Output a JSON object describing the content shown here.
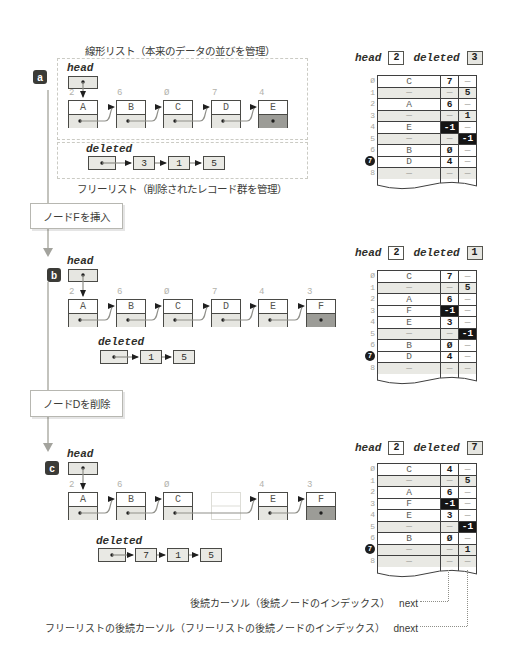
{
  "figure": {
    "linear_list_title": "線形リスト（本来のデータの並びを管理）",
    "free_list_title": "フリーリスト（削除されたレコード群を管理）"
  },
  "steps": [
    {
      "label": "ノードFを挿入"
    },
    {
      "label": "ノードDを削除"
    }
  ],
  "annotations": [
    {
      "text": "後続カーソル（後続ノードのインデックス）",
      "key": "next"
    },
    {
      "text": "フリーリストの後続カーソル（フリーリストの後続ノードのインデックス）",
      "key": "dnext"
    }
  ],
  "colors": {
    "null_cell": "#9c9c97",
    "dark_cell": "#151515",
    "free_row": "#e9e9e4",
    "node_fill": "#e6e6e1",
    "panel_marker": "#3b3b37"
  },
  "panels": [
    {
      "id": "a",
      "head_label": "head",
      "deleted_label": "deleted",
      "nodes": [
        {
          "index": "2",
          "letter": "A"
        },
        {
          "index": "6",
          "letter": "B"
        },
        {
          "index": "Ø",
          "letter": "C"
        },
        {
          "index": "7",
          "letter": "D"
        },
        {
          "index": "4",
          "letter": "E",
          "isNull": true
        }
      ],
      "deleted_chain": [
        "3",
        "1",
        "5"
      ],
      "table": {
        "head_label": "head",
        "head": "2",
        "deleted_label": "deleted",
        "deleted": "3",
        "rows": [
          {
            "i": "Ø",
            "v": "C",
            "n": "7",
            "d": "—"
          },
          {
            "i": "1",
            "v": "—",
            "n": "—",
            "d": "5",
            "free": true
          },
          {
            "i": "2",
            "v": "A",
            "n": "6",
            "d": "—"
          },
          {
            "i": "3",
            "v": "—",
            "n": "—",
            "d": "1",
            "free": true
          },
          {
            "i": "4",
            "v": "E",
            "n": "-1",
            "d": "—"
          },
          {
            "i": "5",
            "v": "—",
            "n": "—",
            "d": "-1",
            "free": true
          },
          {
            "i": "6",
            "v": "B",
            "n": "Ø",
            "d": "—"
          },
          {
            "i": "7",
            "v": "D",
            "n": "4",
            "d": "—",
            "circled": true
          },
          {
            "i": "8",
            "v": "—",
            "n": "—",
            "d": "—",
            "free": true
          }
        ]
      }
    },
    {
      "id": "b",
      "head_label": "head",
      "deleted_label": "deleted",
      "nodes": [
        {
          "index": "2",
          "letter": "A"
        },
        {
          "index": "6",
          "letter": "B"
        },
        {
          "index": "Ø",
          "letter": "C"
        },
        {
          "index": "7",
          "letter": "D"
        },
        {
          "index": "4",
          "letter": "E"
        },
        {
          "index": "3",
          "letter": "F",
          "isNull": true
        }
      ],
      "deleted_chain": [
        "1",
        "5"
      ],
      "table": {
        "head_label": "head",
        "head": "2",
        "deleted_label": "deleted",
        "deleted": "1",
        "rows": [
          {
            "i": "Ø",
            "v": "C",
            "n": "7",
            "d": "—"
          },
          {
            "i": "1",
            "v": "—",
            "n": "—",
            "d": "5",
            "free": true
          },
          {
            "i": "2",
            "v": "A",
            "n": "6",
            "d": "—"
          },
          {
            "i": "3",
            "v": "F",
            "n": "-1",
            "d": "—"
          },
          {
            "i": "4",
            "v": "E",
            "n": "3",
            "d": "—"
          },
          {
            "i": "5",
            "v": "—",
            "n": "—",
            "d": "-1",
            "free": true
          },
          {
            "i": "6",
            "v": "B",
            "n": "Ø",
            "d": "—"
          },
          {
            "i": "7",
            "v": "D",
            "n": "4",
            "d": "—",
            "circled": true
          },
          {
            "i": "8",
            "v": "—",
            "n": "—",
            "d": "—",
            "free": true
          }
        ]
      }
    },
    {
      "id": "c",
      "head_label": "head",
      "deleted_label": "deleted",
      "nodes": [
        {
          "index": "2",
          "letter": "A"
        },
        {
          "index": "6",
          "letter": "B"
        },
        {
          "index": "Ø",
          "letter": "C"
        },
        {
          "ghost": true
        },
        {
          "index": "4",
          "letter": "E"
        },
        {
          "index": "3",
          "letter": "F",
          "isNull": true
        }
      ],
      "deleted_chain": [
        "7",
        "1",
        "5"
      ],
      "table": {
        "head_label": "head",
        "head": "2",
        "deleted_label": "deleted",
        "deleted": "7",
        "rows": [
          {
            "i": "Ø",
            "v": "C",
            "n": "4",
            "d": "—"
          },
          {
            "i": "1",
            "v": "—",
            "n": "—",
            "d": "5",
            "free": true
          },
          {
            "i": "2",
            "v": "A",
            "n": "6",
            "d": "—"
          },
          {
            "i": "3",
            "v": "F",
            "n": "-1",
            "d": "—"
          },
          {
            "i": "4",
            "v": "E",
            "n": "3",
            "d": "—"
          },
          {
            "i": "5",
            "v": "—",
            "n": "—",
            "d": "-1",
            "free": true
          },
          {
            "i": "6",
            "v": "B",
            "n": "Ø",
            "d": "—"
          },
          {
            "i": "7",
            "v": "—",
            "n": "—",
            "d": "1",
            "free": true,
            "circled": true
          },
          {
            "i": "8",
            "v": "—",
            "n": "—",
            "d": "—",
            "free": true
          }
        ]
      }
    }
  ]
}
